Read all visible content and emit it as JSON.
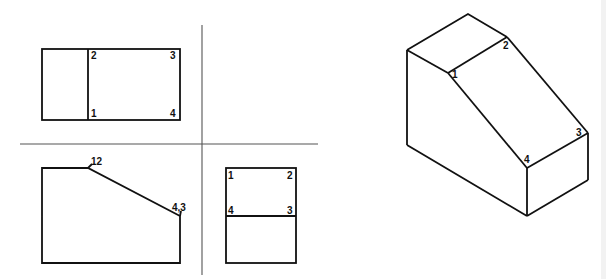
{
  "figure": {
    "type": "orthographic projection with isometric view",
    "views": {
      "top_view": {
        "labels": [
          "2",
          "3",
          "1",
          "4"
        ]
      },
      "front_view": {
        "labels": [
          "12",
          "4,3"
        ]
      },
      "side_view": {
        "labels": [
          "1",
          "2",
          "4",
          "3"
        ]
      },
      "isometric_view": {
        "labels": [
          "1",
          "2",
          "3",
          "4"
        ]
      }
    }
  }
}
